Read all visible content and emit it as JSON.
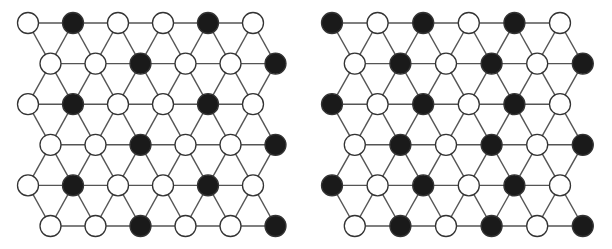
{
  "diagrams": [
    {
      "name": "left-lattice",
      "rows": [
        [
          "W",
          "B",
          "W",
          "W",
          "B",
          "W"
        ],
        [
          "W",
          "W",
          "B",
          "W",
          "W",
          "B"
        ],
        [
          "W",
          "B",
          "W",
          "W",
          "B",
          "W"
        ],
        [
          "W",
          "W",
          "B",
          "W",
          "W",
          "B"
        ],
        [
          "W",
          "B",
          "W",
          "W",
          "B",
          "W"
        ],
        [
          "W",
          "W",
          "B",
          "W",
          "W",
          "B"
        ]
      ]
    },
    {
      "name": "right-lattice",
      "rows": [
        [
          "B",
          "W",
          "B",
          "W",
          "B",
          "W"
        ],
        [
          "W",
          "B",
          "W",
          "B",
          "W",
          "B"
        ],
        [
          "B",
          "W",
          "B",
          "W",
          "B",
          "W"
        ],
        [
          "W",
          "B",
          "W",
          "B",
          "W",
          "B"
        ],
        [
          "B",
          "W",
          "B",
          "W",
          "B",
          "W"
        ],
        [
          "W",
          "B",
          "W",
          "B",
          "W",
          "B"
        ]
      ]
    }
  ],
  "colors": {
    "B": "#1a1a1a",
    "W": "#ffffff",
    "edge": "#555555"
  }
}
